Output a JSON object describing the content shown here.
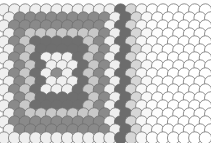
{
  "figure": {
    "background_color": "#fdfdfd",
    "outline_color": "#6e6e6e",
    "outline_width": 0.75
  },
  "chart_data": {
    "type": "heatmap",
    "subtitle": "",
    "xlabel": "",
    "ylabel": "",
    "grid": false,
    "legend_position": "none",
    "annotations": [],
    "geometry": {
      "columns": 20,
      "rows": 17,
      "circle_radius": 6.2,
      "column_pitch": 10.6,
      "row_pitch": 8.0,
      "row_offset_x": 5.3,
      "origin_x": 4.0,
      "origin_y": 10.0,
      "draw_order": "rows top to bottom, later rows overlap earlier rows"
    },
    "center": {
      "column": 5,
      "row": 8
    },
    "band_palette": [
      "#8e8e8e",
      "#f0f0f0",
      "#6f6f6f",
      "#c8c8c8",
      "#8a8a8a",
      "#efefef",
      "#6c6c6c",
      "#d6d6d6",
      "#f7f7f7",
      "#fdfdfd",
      "#ffffff",
      "#ffffff",
      "#ffffff",
      "#ffffff",
      "#ffffff"
    ],
    "band_rule": "shade index = max(|col - center.column|, round(|row - center.row| * 0.62))",
    "categories": [
      "band 0",
      "band 1",
      "band 2",
      "band 3",
      "band 4",
      "band 5",
      "band 6",
      "band 7",
      "band 8",
      "band 9",
      "band 10+"
    ],
    "values": [
      1,
      8,
      16,
      24,
      32,
      40,
      48,
      56,
      64,
      72,
      150
    ],
    "ylim": [
      0,
      160
    ]
  }
}
